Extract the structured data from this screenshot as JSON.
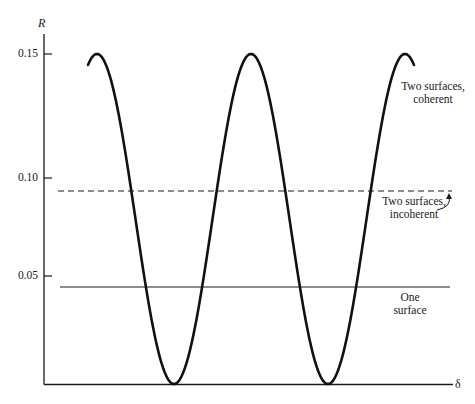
{
  "chart_data": {
    "type": "line",
    "title": "",
    "xlabel": "δ",
    "ylabel": "R",
    "ylim": [
      0,
      0.15
    ],
    "yticks": [
      "0.15",
      "0.10",
      "0.05"
    ],
    "grid": false,
    "legend": "inline annotations at right",
    "series": [
      {
        "name": "Two surfaces, coherent",
        "style": "thick solid oscillating",
        "description": "cos^2-like oscillation between 0 and 0.15",
        "x": [
          0.0,
          0.25,
          0.5,
          0.75,
          1.0,
          1.25,
          1.5,
          1.75,
          2.0
        ],
        "points": [
          {
            "phase": "start",
            "R": 0.14
          },
          {
            "phase": "peak 1",
            "R": 0.15
          },
          {
            "phase": "trough 1",
            "R": 0.0
          },
          {
            "phase": "peak 2",
            "R": 0.15
          },
          {
            "phase": "trough 2",
            "R": 0.0
          },
          {
            "phase": "peak 3",
            "R": 0.15
          },
          {
            "phase": "end",
            "R": 0.14
          }
        ]
      },
      {
        "name": "Two surfaces, incoherent",
        "style": "dashed horizontal",
        "R": 0.093
      },
      {
        "name": "One surface",
        "style": "thin solid horizontal",
        "R": 0.047
      }
    ]
  },
  "labels": {
    "y_axis": "R",
    "x_axis": "δ",
    "tick_015": "0.15",
    "tick_010": "0.10",
    "tick_005": "0.05",
    "coherent_1": "Two surfaces,",
    "coherent_2": "coherent",
    "incoherent_1": "Two surfaces,",
    "incoherent_2": "incoherent",
    "one_1": "One",
    "one_2": "surface"
  }
}
